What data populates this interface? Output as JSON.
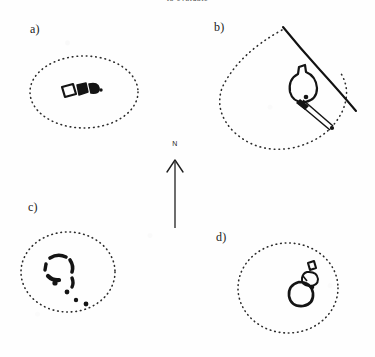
{
  "figure": {
    "caption_top": "to evaluate",
    "width": 375,
    "height": 357,
    "background_color": "#fefefe",
    "ink_color": "#1a1a1a",
    "dotted_boundary_color": "#2b2b2b"
  },
  "north_arrow": {
    "label": "N",
    "name": "north-arrow",
    "bearing_degrees": 0
  },
  "panels": [
    {
      "label": "a)",
      "id": "panel-a",
      "boundary_type": "dotted-oval",
      "feature_description": "rectangular enclosure with attached dark cells",
      "feature_count": 3
    },
    {
      "label": "b)",
      "id": "panel-b",
      "boundary_type": "dotted-rounded-polygon",
      "feature_description": "rounded enclosure with funnel neck and narrow corridor",
      "solid_line_description": "linear boundary wall",
      "feature_count": 2
    },
    {
      "label": "c)",
      "id": "panel-c",
      "boundary_type": "dotted-circle",
      "feature_description": "broken ring of dark fragments with scattered outliers",
      "feature_count": 9
    },
    {
      "label": "d)",
      "id": "panel-d",
      "boundary_type": "dotted-circle",
      "feature_description": "small rounded enclosure with detached rectangle",
      "feature_count": 3
    }
  ]
}
